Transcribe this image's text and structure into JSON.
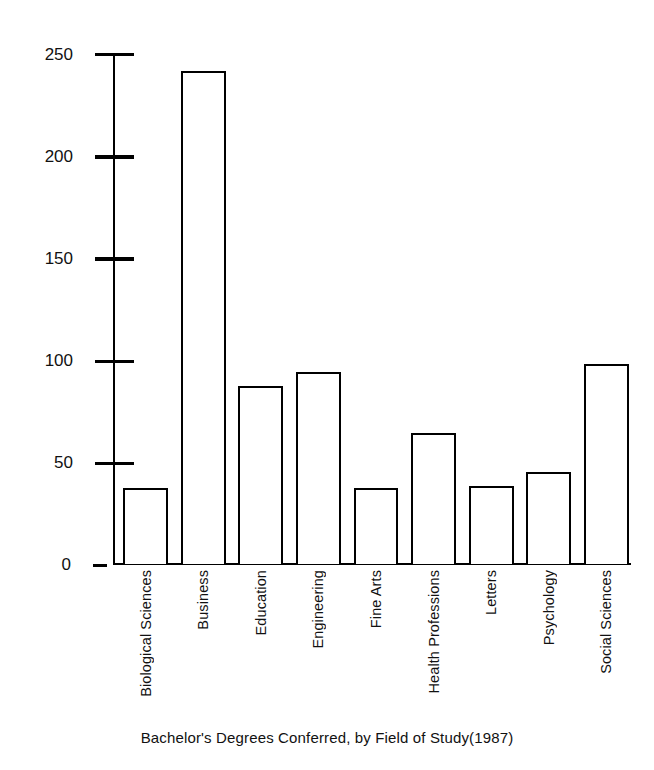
{
  "chart_data": {
    "type": "bar",
    "title": "",
    "caption": "Bachelor's Degrees Conferred, by Field of Study(1987)",
    "xlabel": "",
    "ylabel": "Frequency (thousands)",
    "ylim": [
      0,
      250
    ],
    "yticks": [
      0,
      50,
      100,
      150,
      200,
      250
    ],
    "ytick_labels": [
      "0",
      "50",
      "100",
      "150",
      "200",
      "250"
    ],
    "grid": false,
    "legend": null,
    "categories": [
      "Biological Sciences",
      "Business",
      "Education",
      "Engineering",
      "Fine Arts",
      "Health Professions",
      "Letters",
      "Psychology",
      "Social Sciences"
    ],
    "values": [
      37,
      241,
      87,
      94,
      37,
      64,
      38,
      45,
      98
    ],
    "bar_facecolor": "#ffffff",
    "bar_edgecolor": "#000000",
    "background": "#ffffff"
  },
  "axis": {
    "y_title": "Frequency (thousands)"
  },
  "caption": {
    "text": "Bachelor's Degrees Conferred, by Field of Study(1987)"
  }
}
